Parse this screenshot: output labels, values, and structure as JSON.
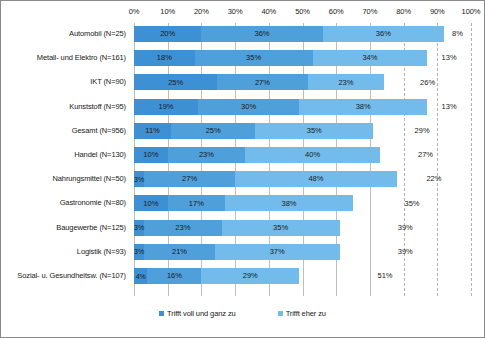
{
  "chart_data": {
    "type": "bar",
    "subtype": "horizontal-stacked-100",
    "title": "",
    "xlabel": "",
    "ylabel": "",
    "xlim": [
      0,
      100
    ],
    "grid": true,
    "legend_position": "bottom",
    "tick_labels": [
      "0%",
      "10%",
      "20%",
      "30%",
      "40%",
      "50%",
      "60%",
      "70%",
      "80%",
      "90%",
      "100%"
    ],
    "tick_values": [
      0,
      10,
      20,
      30,
      40,
      50,
      60,
      70,
      80,
      90,
      100
    ],
    "categories": [
      "Automobil (N=25)",
      "Metall- und Elektro (N=161)",
      "IKT (N=90)",
      "Kunststoff (N=95)",
      "Gesamt (N=956)",
      "Handel (N=130)",
      "Nahrungsmittel (N=50)",
      "Gastronomie (N=80)",
      "Baugewerbe (N=125)",
      "Logistik (N=93)",
      "Sozial- u. Gesundheitsw. (N=107)"
    ],
    "series": [
      {
        "name": "Trifft voll und ganz zu",
        "color": "#3d90d4",
        "values": [
          20,
          18,
          25,
          19,
          11,
          10,
          3,
          10,
          3,
          3,
          4
        ],
        "labels": [
          "20%",
          "18%",
          "25%",
          "19%",
          "11%",
          "10%",
          "3%",
          "10%",
          "3%",
          "3%",
          "4%"
        ]
      },
      {
        "name": "Trifft eher zu",
        "color": "#4e9fda",
        "values": [
          36,
          35,
          27,
          30,
          25,
          23,
          27,
          17,
          23,
          21,
          16
        ],
        "labels": [
          "36%",
          "35%",
          "27%",
          "30%",
          "25%",
          "23%",
          "27%",
          "17%",
          "23%",
          "21%",
          "16%"
        ]
      },
      {
        "name": "",
        "color": "#73bbea",
        "values": [
          36,
          34,
          23,
          38,
          35,
          40,
          48,
          38,
          35,
          37,
          29
        ],
        "labels": [
          "36%",
          "34%",
          "23%",
          "38%",
          "35%",
          "40%",
          "48%",
          "38%",
          "35%",
          "37%",
          "29%"
        ]
      },
      {
        "name": "",
        "color": "#ffffff",
        "values": [
          8,
          13,
          26,
          13,
          29,
          27,
          22,
          35,
          39,
          39,
          51
        ],
        "labels": [
          "8%",
          "13%",
          "26%",
          "13%",
          "29%",
          "27%",
          "22%",
          "35%",
          "39%",
          "39%",
          "51%"
        ]
      }
    ]
  },
  "legend": {
    "items": [
      {
        "label": "Trifft voll und ganz zu",
        "color": "#3d90d4"
      },
      {
        "label": "Trifft eher zu",
        "color": "#73bbea"
      }
    ]
  }
}
